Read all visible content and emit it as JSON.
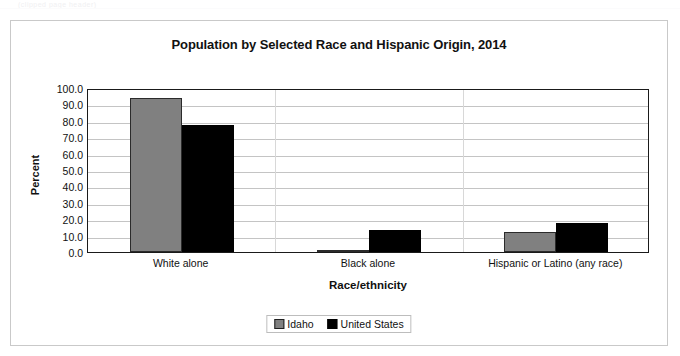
{
  "top_artifact": {
    "text": "(clipped page header)"
  },
  "chart_data": {
    "type": "bar",
    "title": "Population by Selected Race and Hispanic Origin, 2014",
    "xlabel": "Race/ethnicity",
    "ylabel": "Percent",
    "ylim": [
      0,
      100
    ],
    "ytick_step": 10,
    "ytick_labels": [
      "0.0",
      "10.0",
      "20.0",
      "30.0",
      "40.0",
      "50.0",
      "60.0",
      "70.0",
      "80.0",
      "90.0",
      "100.0"
    ],
    "grid": true,
    "legend_position": "bottom-center",
    "categories": [
      "White alone",
      "Black alone",
      "Hispanic or Latino (any race)"
    ],
    "series": [
      {
        "name": "Idaho",
        "color": "#808080",
        "values": [
          93.8,
          0.8,
          12.2
        ]
      },
      {
        "name": "United States",
        "color": "#000000",
        "values": [
          77.4,
          13.2,
          17.4
        ]
      }
    ]
  },
  "legend": {
    "entries": [
      {
        "label": "Idaho"
      },
      {
        "label": "United States"
      }
    ]
  }
}
